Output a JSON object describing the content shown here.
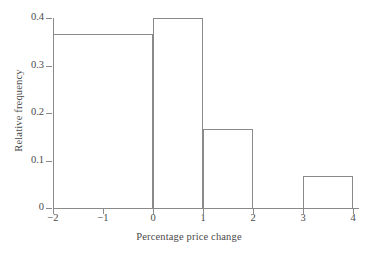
{
  "chart_data": {
    "type": "bar",
    "title": "",
    "subtitle": "",
    "xlabel": "Percentage price change",
    "ylabel": "Relative frequency",
    "xlim": [
      -2,
      4
    ],
    "ylim": [
      0,
      0.4
    ],
    "grid": false,
    "legend": null,
    "histogram": true,
    "bin_edges": [
      -2,
      0,
      1,
      2,
      3,
      4
    ],
    "categories": [
      "-2 to 0",
      "0 to 1",
      "1 to 2",
      "2 to 3",
      "3 to 4"
    ],
    "values": [
      0.367,
      0.4,
      0.167,
      0,
      0.067
    ],
    "xticks": [
      -2,
      -1,
      0,
      1,
      2,
      3,
      4
    ],
    "xtick_labels": [
      "−2",
      "−1",
      "0",
      "1",
      "2",
      "3",
      "4"
    ],
    "yticks": [
      0,
      0.1,
      0.2,
      0.3,
      0.4
    ],
    "ytick_labels": [
      "0",
      "0.1",
      "0.2",
      "0.3",
      "0.4"
    ],
    "line_color": "#8a8a8a",
    "text_color": "#4a4a4a",
    "background": "#ffffff",
    "bars": [
      {
        "label": "-2 to 0",
        "x0": -2,
        "x1": 0,
        "value": 0.367
      },
      {
        "label": "0 to 1",
        "x0": 0,
        "x1": 1,
        "value": 0.4
      },
      {
        "label": "1 to 2",
        "x0": 1,
        "x1": 2,
        "value": 0.167
      },
      {
        "label": "2 to 3",
        "x0": 2,
        "x1": 3,
        "value": 0
      },
      {
        "label": "3 to 4",
        "x0": 3,
        "x1": 4,
        "value": 0.067
      }
    ]
  }
}
